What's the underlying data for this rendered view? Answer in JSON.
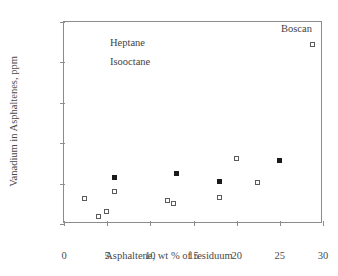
{
  "chart_data": {
    "type": "scatter",
    "title": "",
    "xlabel": "Asphaltene, wt % of residuum",
    "ylabel": "Vanadium in Asphaltenes, ppm",
    "xlim": [
      0,
      30
    ],
    "ylim": [
      0,
      5000
    ],
    "xticks": [
      0,
      5,
      10,
      15,
      20,
      25,
      30
    ],
    "yticks": [
      0,
      1000,
      2000,
      3000,
      4000,
      5000
    ],
    "xtick_labels": [
      "0",
      "5",
      "10",
      "15",
      "20",
      "25",
      "30"
    ],
    "ytick_labels": [
      "0",
      "1000",
      "2000",
      "3000",
      "4000",
      "5000"
    ],
    "grid": false,
    "legend_position": "inside-upper-left-as-text",
    "series": [
      {
        "name": "Heptane",
        "marker": "filled-square",
        "color": "#1a1a1a",
        "points": [
          {
            "x": 5.9,
            "y": 1140
          },
          {
            "x": 13.0,
            "y": 1240
          },
          {
            "x": 18.0,
            "y": 1060
          },
          {
            "x": 25.0,
            "y": 1570
          }
        ]
      },
      {
        "name": "Isooctane",
        "marker": "open-square",
        "color": "#5a5a5a",
        "points": [
          {
            "x": 2.4,
            "y": 620
          },
          {
            "x": 4.0,
            "y": 180
          },
          {
            "x": 4.9,
            "y": 300
          },
          {
            "x": 5.9,
            "y": 800
          },
          {
            "x": 12.0,
            "y": 570
          },
          {
            "x": 12.7,
            "y": 510
          },
          {
            "x": 18.0,
            "y": 660
          },
          {
            "x": 20.0,
            "y": 1620
          },
          {
            "x": 22.4,
            "y": 1020
          },
          {
            "x": 28.8,
            "y": 4450
          }
        ]
      }
    ],
    "annotations": [
      {
        "text": "Heptane",
        "x": 5.5,
        "y": 4630,
        "name": "heptane"
      },
      {
        "text": "Isooctane",
        "x": 5.5,
        "y": 4160,
        "name": "isooctane"
      },
      {
        "text": "Boscan",
        "x": 25.3,
        "y": 4960,
        "name": "boscan"
      }
    ]
  }
}
